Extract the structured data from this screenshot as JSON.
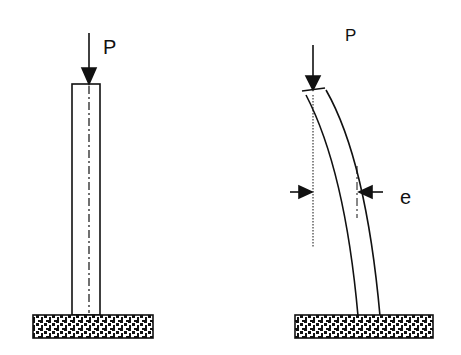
{
  "diagram": {
    "left_column": {
      "load_label": "P",
      "state": "straight"
    },
    "right_column": {
      "load_label": "P",
      "eccentricity_label": "e",
      "state": "deflected"
    }
  }
}
